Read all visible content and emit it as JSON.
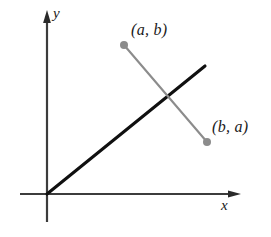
{
  "figure": {
    "background_color": "#ffffff",
    "width": 271,
    "height": 237
  },
  "axes": {
    "x_label": "x",
    "y_label": "y",
    "axis_color": "#3c3c3c",
    "origin": {
      "x": 47,
      "y": 194
    },
    "x_axis": {
      "x_start": 20,
      "x_end": 240,
      "y": 194,
      "arrow": "right"
    },
    "y_axis": {
      "x": 47,
      "y_start": 222,
      "y_end": 11,
      "arrow": "up"
    }
  },
  "lines": {
    "identity_line": {
      "name": "line-y-equals-x",
      "color": "#101010",
      "width": 3,
      "from": {
        "x": 47,
        "y": 194
      },
      "to": {
        "x": 205,
        "y": 66
      }
    },
    "segment_line": {
      "name": "reflection-segment",
      "color": "#8c8c8c",
      "width": 2,
      "from": {
        "x": 124,
        "y": 45
      },
      "to": {
        "x": 207,
        "y": 142
      }
    }
  },
  "points": [
    {
      "name": "point-a-b",
      "label": "(a, b)",
      "x": 124,
      "y": 45,
      "radius": 4,
      "color": "#8c8c8c"
    },
    {
      "name": "point-b-a",
      "label": "(b, a)",
      "x": 207,
      "y": 142,
      "radius": 4,
      "color": "#8c8c8c"
    }
  ],
  "colors": {
    "background": "#ffffff",
    "axis": "#3c3c3c",
    "identity": "#101010",
    "segment": "#8c8c8c",
    "text": "#1a1a1a"
  }
}
